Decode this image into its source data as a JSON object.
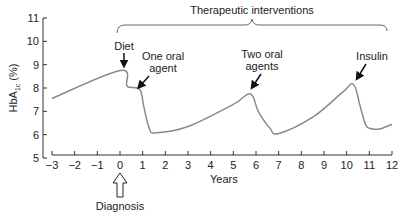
{
  "chart_data": {
    "type": "line",
    "title": "",
    "xlabel": "Years",
    "ylabel": "HbA1c (%)",
    "ylabel_main": "HbA",
    "ylabel_sub": "1c",
    "ylabel_suffix": " (%)",
    "xlim": [
      -3,
      12
    ],
    "ylim": [
      5,
      11
    ],
    "grid": false,
    "legend": null,
    "x_ticks": [
      -3,
      -2,
      -1,
      0,
      1,
      2,
      3,
      4,
      5,
      6,
      7,
      8,
      9,
      10,
      11,
      12
    ],
    "x_tick_labels": [
      "−3",
      "−2",
      "−1",
      "0",
      "1",
      "2",
      "3",
      "4",
      "5",
      "6",
      "7",
      "8",
      "9",
      "10",
      "11",
      "12"
    ],
    "y_ticks": [
      5,
      6,
      7,
      8,
      9,
      10,
      11
    ],
    "y_tick_labels": [
      "5",
      "6",
      "7",
      "8",
      "9",
      "10",
      "11"
    ],
    "series": [
      {
        "name": "HbA1c",
        "color": "#8a8a8a",
        "x": [
          -3,
          0,
          0.3,
          0.55,
          0.9,
          1.05,
          1.3,
          1.6,
          3,
          5.0,
          5.75,
          6.1,
          6.6,
          7.0,
          8.5,
          9.8,
          10.3,
          10.6,
          10.85,
          11.1,
          11.5,
          12
        ],
        "y": [
          7.55,
          8.75,
          8.1,
          8.02,
          7.9,
          7.2,
          6.25,
          6.08,
          6.35,
          7.3,
          7.75,
          7.0,
          6.3,
          6.05,
          6.75,
          7.8,
          8.15,
          7.2,
          6.4,
          6.25,
          6.25,
          6.45
        ]
      }
    ],
    "annotations": [
      {
        "label": "Diet",
        "x": 0,
        "y": 8.75,
        "type": "arrow-down"
      },
      {
        "label_lines": [
          "One oral",
          "agent"
        ],
        "x": 0.75,
        "y": 8.0,
        "type": "arrow-diagonal"
      },
      {
        "label_lines": [
          "Two oral",
          "agents"
        ],
        "x": 5.75,
        "y": 7.75,
        "type": "arrow-diagonal"
      },
      {
        "label": "Insulin",
        "x": 10.3,
        "y": 8.15,
        "type": "arrow-diagonal"
      },
      {
        "label": "Diagnosis",
        "x": 0,
        "type": "hollow-arrow-up-below-axis"
      },
      {
        "label": "Therapeutic interventions",
        "x_range": [
          0,
          12
        ],
        "type": "brace-over"
      }
    ]
  },
  "labels": {
    "diet": "Diet",
    "one_oral_1": "One oral",
    "one_oral_2": "agent",
    "two_oral_1": "Two oral",
    "two_oral_2": "agents",
    "insulin": "Insulin",
    "diagnosis": "Diagnosis",
    "therapeutic": "Therapeutic interventions",
    "xlabel": "Years"
  },
  "colors": {
    "axis": "#333333",
    "curve": "#8a8a8a",
    "text": "#222222",
    "bracket": "#666666"
  }
}
